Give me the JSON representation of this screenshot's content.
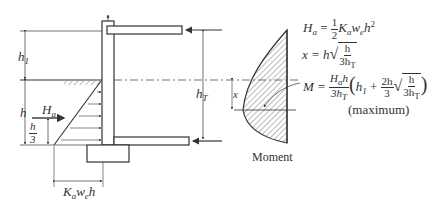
{
  "diagram": {
    "type": "braced-wall-moment-diagram",
    "labels": {
      "h1": "h",
      "h1_sub": "1",
      "h": "h",
      "Ha": "H",
      "Ha_sub": "a",
      "h_over_3_num": "h",
      "h_over_3_den": "3",
      "hT": "h",
      "hT_sub": "T",
      "x": "x",
      "base_width": "K",
      "base_width_sub1": "a",
      "base_width_mid": "w",
      "base_width_sub2": "e",
      "base_width_end": "h",
      "moment_caption": "Moment"
    },
    "equations": {
      "eq1_lhs": "H",
      "eq1_lhs_sub": "a",
      "eq1_eq": " = ",
      "eq1_frac_num": "1",
      "eq1_frac_den": "2",
      "eq1_rhs": "K",
      "eq1_rhs_sub1": "a",
      "eq1_rhs_w": "w",
      "eq1_rhs_sub2": "e",
      "eq1_rhs_h": "h",
      "eq1_rhs_pow": "2",
      "eq2_lhs": "x = h",
      "eq2_num": "h",
      "eq2_den": "3h",
      "eq2_den_sub": "T",
      "eq3_lhs": "M = ",
      "eq3_num": "H",
      "eq3_num_sub": "a",
      "eq3_num_h": "h",
      "eq3_den": "3h",
      "eq3_den_sub": "T",
      "eq3_paren_open": "(",
      "eq3_h1": "h",
      "eq3_h1_sub": "1",
      "eq3_plus": " + ",
      "eq3_f2_num": "2h",
      "eq3_f2_den": "3",
      "eq3_r_num": "h",
      "eq3_r_den": "3h",
      "eq3_r_den_sub": "T",
      "eq3_paren_close": ")",
      "note": "(maximum)"
    },
    "colors": {
      "line": "#333333",
      "hatch": "#555555",
      "background": "#ffffff"
    }
  }
}
